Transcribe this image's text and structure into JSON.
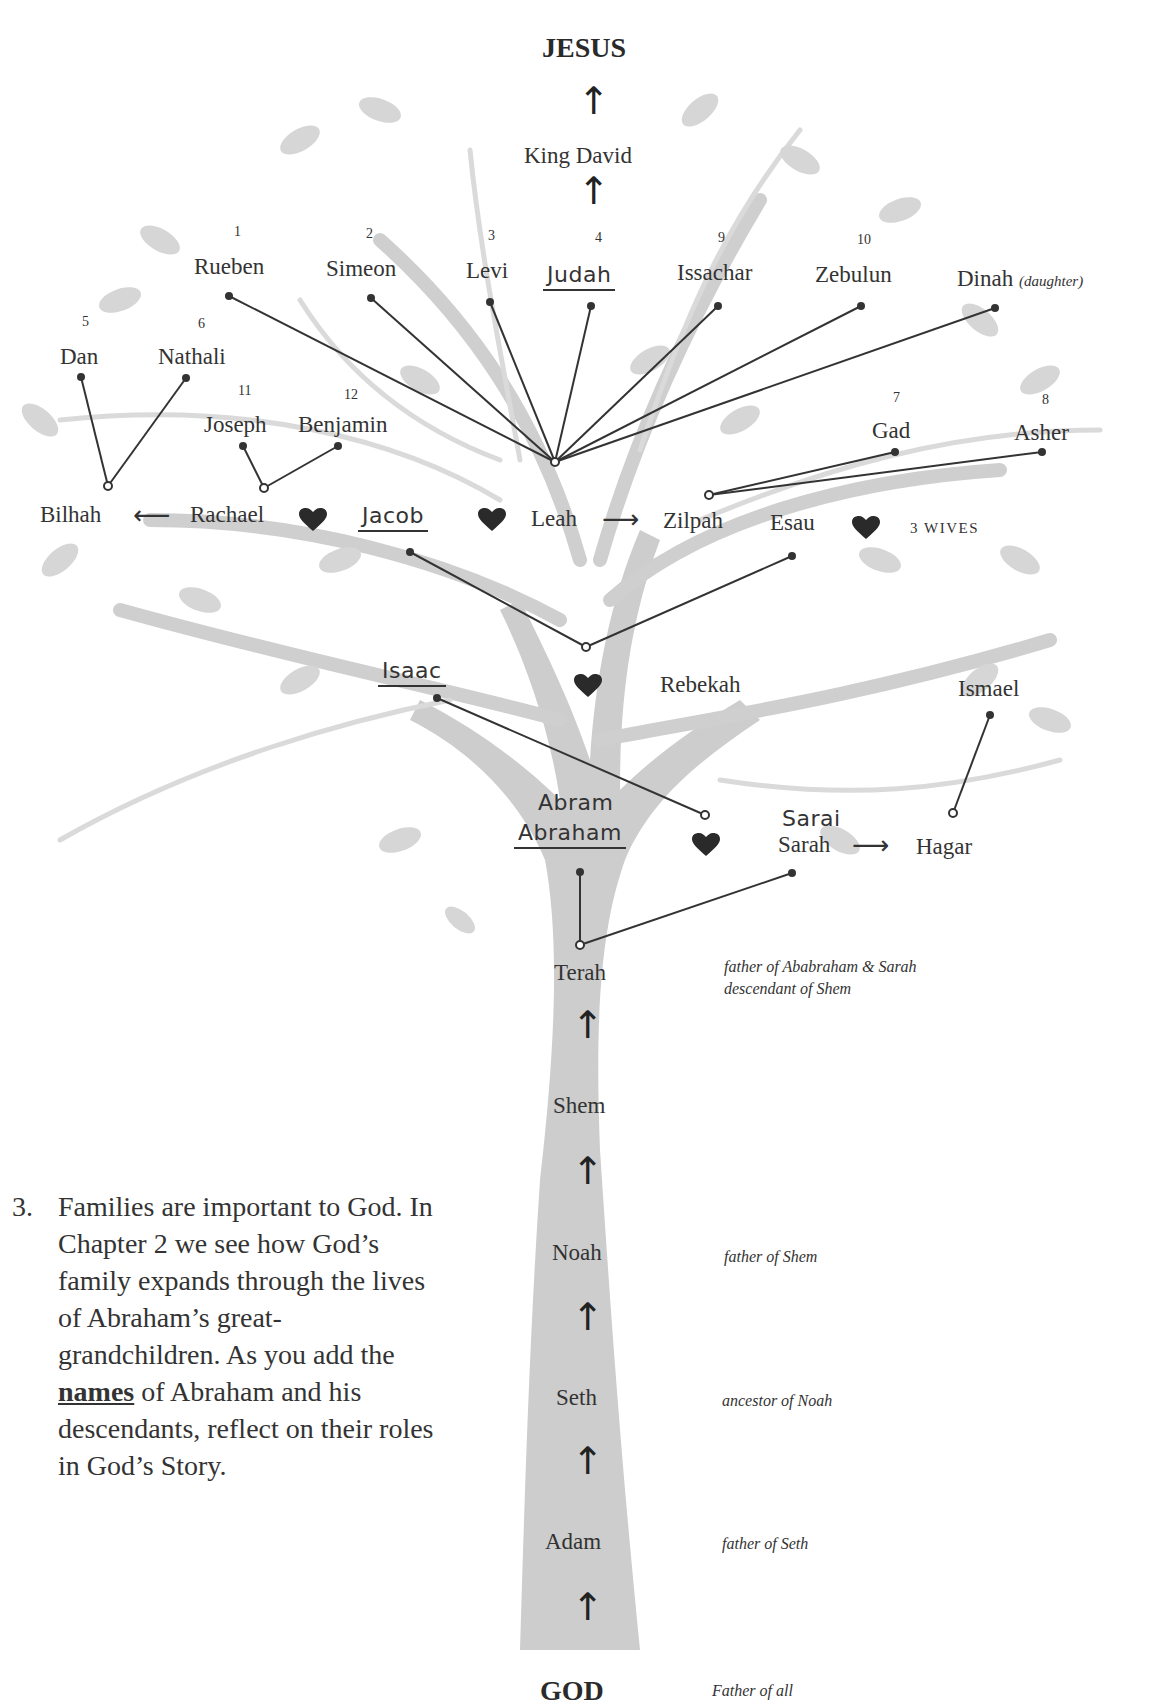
{
  "title": "JESUS",
  "bottom": {
    "label": "GOD",
    "note": "Father of all"
  },
  "top_chain": [
    "King David"
  ],
  "sons": [
    {
      "num": "1",
      "name": "Rueben"
    },
    {
      "num": "2",
      "name": "Simeon"
    },
    {
      "num": "3",
      "name": "Levi"
    },
    {
      "num": "4",
      "name": "Judah",
      "handwritten": true
    },
    {
      "num": "9",
      "name": "Issachar"
    },
    {
      "num": "10",
      "name": "Zebulun"
    },
    {
      "num": "",
      "name": "Dinah",
      "note": "(daughter)"
    },
    {
      "num": "5",
      "name": "Dan"
    },
    {
      "num": "6",
      "name": "Nathali"
    },
    {
      "num": "11",
      "name": "Joseph"
    },
    {
      "num": "12",
      "name": "Benjamin"
    },
    {
      "num": "7",
      "name": "Gad"
    },
    {
      "num": "8",
      "name": "Asher"
    }
  ],
  "jacob_row": {
    "bilhah": "Bilhah",
    "rachael": "Rachael",
    "jacob": "Jacob",
    "leah": "Leah",
    "zilpah": "Zilpah",
    "esau": "Esau",
    "esau_wives": "3 wives"
  },
  "isaac_row": {
    "isaac": "Isaac",
    "rebekah": "Rebekah",
    "ismael": "Ismael"
  },
  "abraham_row": {
    "abram": "Abram",
    "abraham": "Abraham",
    "sarai": "Sarai",
    "sarah": "Sarah",
    "hagar": "Hagar"
  },
  "trunk": [
    {
      "name": "Terah",
      "note": [
        "father of Ababraham & Sarah",
        "descendant of Shem"
      ]
    },
    {
      "name": "Shem",
      "note": []
    },
    {
      "name": "Noah",
      "note": [
        "father of Shem"
      ]
    },
    {
      "name": "Seth",
      "note": [
        "ancestor of Noah"
      ]
    },
    {
      "name": "Adam",
      "note": [
        "father of Seth"
      ]
    }
  ],
  "instructions": {
    "number": "3.",
    "text_before": "Families are important to God. In Chapter 2 we see how God’s family expands through the lives of Abraham’s great-grandchildren. As you add the ",
    "emphasis": "names",
    "text_after": " of Abraham and his descendants, reflect on their roles in God’s Story."
  },
  "colors": {
    "tree": "#c9c9c9",
    "leaf": "#d4d4d4",
    "ink": "#333333",
    "heart": "#2a2a2a"
  }
}
